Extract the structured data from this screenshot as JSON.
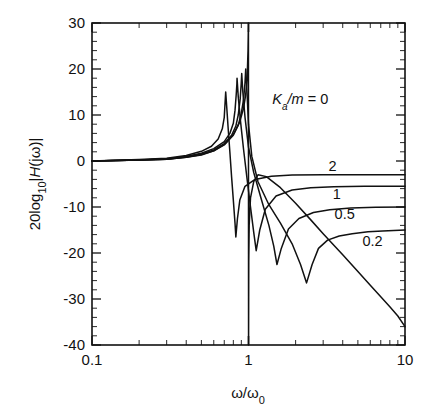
{
  "chart_data": {
    "type": "line",
    "title": "",
    "subtitle": "",
    "xlabel": "ω/ω₀",
    "ylabel": "20log₁₀|H(jω)|",
    "xscale": "log",
    "xlim": [
      0.1,
      10
    ],
    "ylim": [
      -40,
      30
    ],
    "ytick_step": 10,
    "yminor_step": 2,
    "grid": false,
    "legend_position": "inline-annotations",
    "legend_title": "Kₐ/m",
    "x_tick_labels": [
      "0.1",
      "1",
      "10"
    ],
    "x_tick_values": [
      0.1,
      1,
      10
    ],
    "y_tick_labels": [
      "30",
      "20",
      "10",
      "0",
      "-10",
      "-20",
      "-30",
      "-40"
    ],
    "y_tick_values": [
      30,
      20,
      10,
      0,
      -10,
      -20,
      -30,
      -40
    ],
    "annotations": [
      {
        "text": "Kₐ/m = 0",
        "x": 1.42,
        "y": 12.5,
        "series": "0"
      },
      {
        "text": "2",
        "x": 3.25,
        "y": -2.2,
        "series": "2"
      },
      {
        "text": "1",
        "x": 3.45,
        "y": -8.2,
        "series": "1"
      },
      {
        "text": "0.5",
        "x": 3.55,
        "y": -12.6,
        "series": "0.5"
      },
      {
        "text": "0.2",
        "x": 5.35,
        "y": -18.4,
        "series": "0.2"
      }
    ],
    "series": [
      {
        "name": "0",
        "label": "Kₐ/m = 0",
        "peak_x": 1.0,
        "peak_y": 30,
        "notch_x": 1.0,
        "notch_y": -40,
        "value_at_10": -36,
        "value_at_0p1": 0,
        "points": [
          [
            0.1,
            0.0
          ],
          [
            0.15,
            0.1
          ],
          [
            0.2,
            0.2
          ],
          [
            0.3,
            0.4
          ],
          [
            0.4,
            0.8
          ],
          [
            0.5,
            1.3
          ],
          [
            0.6,
            2.2
          ],
          [
            0.7,
            3.6
          ],
          [
            0.8,
            5.8
          ],
          [
            0.88,
            8.5
          ],
          [
            0.93,
            11.5
          ],
          [
            0.96,
            14.5
          ],
          [
            0.98,
            18.0
          ],
          [
            0.993,
            24.0
          ],
          [
            0.999,
            30.0
          ],
          [
            1.001,
            -40.0
          ],
          [
            1.004,
            -22.0
          ],
          [
            1.01,
            -14.0
          ],
          [
            1.03,
            -8.0
          ],
          [
            1.08,
            -4.5
          ],
          [
            1.15,
            -3.0
          ],
          [
            1.3,
            -3.4
          ],
          [
            1.6,
            -5.8
          ],
          [
            2.0,
            -9.2
          ],
          [
            2.5,
            -12.8
          ],
          [
            3.0,
            -15.8
          ],
          [
            4.0,
            -20.4
          ],
          [
            5.0,
            -24.0
          ],
          [
            6.0,
            -27.0
          ],
          [
            7.0,
            -29.5
          ],
          [
            8.0,
            -31.7
          ],
          [
            9.0,
            -33.7
          ],
          [
            10.0,
            -36.0
          ]
        ]
      },
      {
        "name": "0.2",
        "label": "0.2",
        "peak_x": 0.96,
        "peak_y": 20,
        "notch_x": 2.35,
        "notch_y": -26.5,
        "value_at_10": -15,
        "value_at_0p1": 0,
        "points": [
          [
            0.1,
            0.0
          ],
          [
            0.2,
            0.2
          ],
          [
            0.3,
            0.4
          ],
          [
            0.4,
            0.8
          ],
          [
            0.5,
            1.4
          ],
          [
            0.6,
            2.2
          ],
          [
            0.7,
            3.5
          ],
          [
            0.8,
            5.6
          ],
          [
            0.86,
            7.8
          ],
          [
            0.9,
            10.4
          ],
          [
            0.93,
            13.4
          ],
          [
            0.95,
            17.0
          ],
          [
            0.96,
            20.0
          ],
          [
            0.975,
            16.0
          ],
          [
            1.0,
            8.0
          ],
          [
            1.05,
            1.0
          ],
          [
            1.15,
            -4.5
          ],
          [
            1.35,
            -9.5
          ],
          [
            1.6,
            -13.5
          ],
          [
            1.9,
            -18.0
          ],
          [
            2.15,
            -22.5
          ],
          [
            2.35,
            -26.5
          ],
          [
            2.55,
            -22.5
          ],
          [
            2.8,
            -19.0
          ],
          [
            3.2,
            -17.2
          ],
          [
            3.8,
            -16.3
          ],
          [
            4.6,
            -15.8
          ],
          [
            5.8,
            -15.4
          ],
          [
            7.2,
            -15.2
          ],
          [
            10.0,
            -15.0
          ]
        ]
      },
      {
        "name": "0.5",
        "label": "0.5",
        "peak_x": 0.905,
        "peak_y": 19,
        "notch_x": 1.52,
        "notch_y": -22.5,
        "value_at_10": -10,
        "value_at_0p1": 0,
        "points": [
          [
            0.1,
            0.0
          ],
          [
            0.2,
            0.2
          ],
          [
            0.3,
            0.4
          ],
          [
            0.4,
            0.9
          ],
          [
            0.5,
            1.5
          ],
          [
            0.6,
            2.4
          ],
          [
            0.7,
            3.8
          ],
          [
            0.78,
            5.6
          ],
          [
            0.83,
            7.6
          ],
          [
            0.86,
            10.0
          ],
          [
            0.885,
            13.5
          ],
          [
            0.898,
            16.8
          ],
          [
            0.905,
            19.0
          ],
          [
            0.92,
            15.0
          ],
          [
            0.95,
            9.5
          ],
          [
            1.0,
            3.0
          ],
          [
            1.08,
            -2.5
          ],
          [
            1.2,
            -8.0
          ],
          [
            1.35,
            -14.0
          ],
          [
            1.45,
            -18.5
          ],
          [
            1.52,
            -22.5
          ],
          [
            1.62,
            -19.0
          ],
          [
            1.8,
            -14.8
          ],
          [
            2.1,
            -12.5
          ],
          [
            2.6,
            -11.2
          ],
          [
            3.3,
            -10.6
          ],
          [
            4.5,
            -10.2
          ],
          [
            6.5,
            -10.05
          ],
          [
            10.0,
            -10.0
          ]
        ]
      },
      {
        "name": "1",
        "label": "1",
        "peak_x": 0.845,
        "peak_y": 18,
        "notch_x": 1.12,
        "notch_y": -19.5,
        "value_at_10": -5.5,
        "value_at_0p1": 0,
        "points": [
          [
            0.1,
            0.0
          ],
          [
            0.2,
            0.2
          ],
          [
            0.3,
            0.5
          ],
          [
            0.4,
            1.0
          ],
          [
            0.5,
            1.7
          ],
          [
            0.6,
            2.7
          ],
          [
            0.7,
            4.2
          ],
          [
            0.76,
            6.0
          ],
          [
            0.8,
            8.2
          ],
          [
            0.82,
            11.0
          ],
          [
            0.835,
            14.5
          ],
          [
            0.843,
            16.8
          ],
          [
            0.845,
            18.0
          ],
          [
            0.86,
            14.0
          ],
          [
            0.89,
            8.5
          ],
          [
            0.93,
            2.5
          ],
          [
            0.98,
            -4.0
          ],
          [
            1.03,
            -10.0
          ],
          [
            1.08,
            -15.5
          ],
          [
            1.12,
            -19.5
          ],
          [
            1.18,
            -15.0
          ],
          [
            1.28,
            -10.5
          ],
          [
            1.5,
            -7.6
          ],
          [
            1.9,
            -6.3
          ],
          [
            2.5,
            -5.8
          ],
          [
            3.5,
            -5.6
          ],
          [
            5.5,
            -5.5
          ],
          [
            10.0,
            -5.5
          ]
        ]
      },
      {
        "name": "2",
        "label": "2",
        "peak_x": 0.715,
        "peak_y": 15,
        "notch_x": 0.83,
        "notch_y": -16.5,
        "value_at_10": -3,
        "value_at_0p1": 0,
        "points": [
          [
            0.1,
            0.0
          ],
          [
            0.2,
            0.3
          ],
          [
            0.3,
            0.6
          ],
          [
            0.4,
            1.2
          ],
          [
            0.5,
            2.1
          ],
          [
            0.58,
            3.2
          ],
          [
            0.64,
            4.8
          ],
          [
            0.68,
            7.0
          ],
          [
            0.7,
            9.5
          ],
          [
            0.708,
            12.5
          ],
          [
            0.715,
            15.0
          ],
          [
            0.725,
            12.0
          ],
          [
            0.74,
            7.5
          ],
          [
            0.76,
            2.0
          ],
          [
            0.78,
            -3.5
          ],
          [
            0.8,
            -8.5
          ],
          [
            0.82,
            -13.5
          ],
          [
            0.83,
            -16.5
          ],
          [
            0.85,
            -12.5
          ],
          [
            0.88,
            -8.5
          ],
          [
            0.95,
            -5.5
          ],
          [
            1.1,
            -4.0
          ],
          [
            1.4,
            -3.3
          ],
          [
            1.9,
            -3.05
          ],
          [
            3.0,
            -3.0
          ],
          [
            5.0,
            -3.0
          ],
          [
            10.0,
            -3.0
          ]
        ]
      }
    ]
  }
}
